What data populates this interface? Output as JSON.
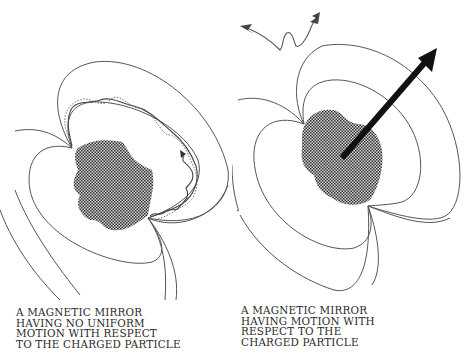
{
  "figure": {
    "colors": {
      "background": "#ffffff",
      "line": "#555555",
      "dotted_path": "#777777",
      "body_fill": "#3a3a3a",
      "arrow": "#111111",
      "text": "#2a2a2a"
    },
    "panels": [
      {
        "id": "left",
        "caption_lines": [
          "A MAGNETIC MIRROR",
          "HAVING NO UNIFORM",
          "MOTION WITH RESPECT",
          "TO THE CHARGED PARTICLE"
        ],
        "elements": [
          "magnetic-field-lines",
          "checkered-magnetic-body",
          "spiraling-particle-path",
          "dotted-guiding-orbit"
        ]
      },
      {
        "id": "right",
        "caption_lines": [
          "A MAGNETIC MIRROR",
          "HAVING MOTION WITH",
          "RESPECT TO THE",
          "CHARGED PARTICLE"
        ],
        "elements": [
          "magnetic-field-lines",
          "checkered-magnetic-body",
          "motion-vector-arrow",
          "particle-incoming-arrow",
          "particle-outgoing-arrow"
        ]
      }
    ]
  }
}
